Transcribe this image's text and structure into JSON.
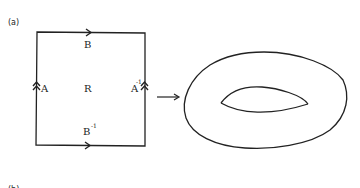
{
  "figure": {
    "part_label_a": "(a)",
    "part_label_b": "(b)",
    "square": {
      "top_edge_label": "B",
      "bottom_edge_label": "B",
      "bottom_edge_superscript": "-1",
      "left_edge_label": "A",
      "right_edge_label": "A",
      "right_edge_superscript": "-1",
      "center_label": "R"
    },
    "arrow": "→",
    "result_shape": "torus",
    "stroke_color": "#222222",
    "background_color": "#ffffff"
  }
}
